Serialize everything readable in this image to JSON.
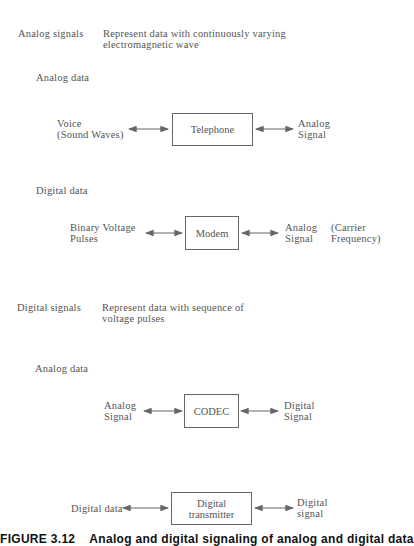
{
  "sections": [
    {
      "title": "Analog signals",
      "description_lines": [
        "Represent data with continuously varying",
        "electromagnetic wave"
      ],
      "subsections": [
        {
          "label": "Analog data",
          "left_lines": [
            "Voice",
            "(Sound Waves)"
          ],
          "box": "Telephone",
          "right_lines": [
            "Analog",
            "Signal"
          ]
        },
        {
          "label": "Digital data",
          "left_lines": [
            "Binary Voltage",
            "Pulses"
          ],
          "box": "Modem",
          "right_lines": [
            "Analog",
            "Signal"
          ],
          "right_note_lines": [
            "(Carrier",
            "Frequency)"
          ]
        }
      ]
    },
    {
      "title": "Digital signals",
      "description_lines": [
        "Represent data with sequence of",
        "voltage pulses"
      ],
      "subsections": [
        {
          "label": "Analog data",
          "left_lines": [
            "Analog",
            "Signal"
          ],
          "box": "CODEC",
          "right_lines": [
            "Digital",
            "Signal"
          ]
        },
        {
          "label": "",
          "left_lines": [
            "Digital data"
          ],
          "box_lines": [
            "Digital",
            "transmitter"
          ],
          "right_lines": [
            "Digital",
            "signal"
          ]
        }
      ]
    }
  ],
  "caption": {
    "number": "FIGURE 3.12",
    "text": "Analog and digital signaling of analog and digital data"
  },
  "colors": {
    "text": "#555555",
    "lines": "#666666",
    "caption": "#111111"
  }
}
